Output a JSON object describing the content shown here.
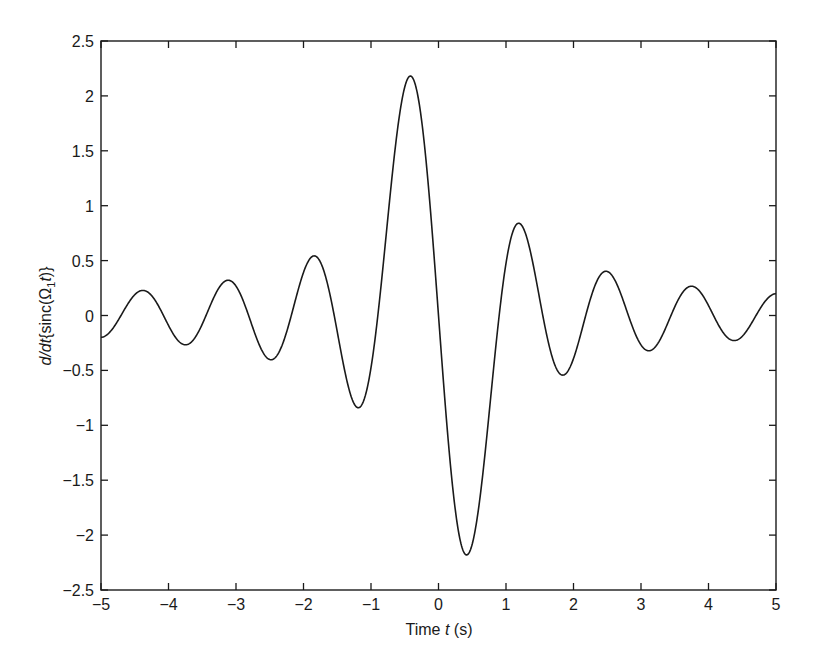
{
  "chart_data": {
    "type": "line",
    "title": "",
    "xlabel": "Time t (s)",
    "xlabel_parts": {
      "prefix": "Time ",
      "italic": "t",
      "suffix": " (s)"
    },
    "ylabel": "d/dt{sinc(Ω1t)}",
    "ylabel_parts": {
      "italic1": "d/dt",
      "mid": "{sinc(Ω",
      "sub": "1",
      "italic2": "t",
      "suffix": ")}"
    },
    "xlim": [
      -5,
      5
    ],
    "ylim": [
      -2.5,
      2.5
    ],
    "xticks": [
      -5,
      -4,
      -3,
      -2,
      -1,
      0,
      1,
      2,
      3,
      4,
      5
    ],
    "xtick_labels": [
      "−5",
      "−4",
      "−3",
      "−2",
      "−1",
      "0",
      "1",
      "2",
      "3",
      "4",
      "5"
    ],
    "yticks": [
      -2.5,
      -2,
      -1.5,
      -1,
      -0.5,
      0,
      0.5,
      1,
      1.5,
      2,
      2.5
    ],
    "ytick_labels": [
      "−2.5",
      "−2",
      "−1.5",
      "−1",
      "−0.5",
      "0",
      "0.5",
      "1",
      "1.5",
      "2",
      "2.5"
    ],
    "grid": false,
    "legend": null,
    "function": {
      "expression": "cos(Ω1 t)/t − sin(Ω1 t)/(Ω1 t²)",
      "omega1": 5
    },
    "series": [
      {
        "name": "d/dt{sinc(Ω1t)}",
        "color": "#1a1a1a",
        "x": [
          -5,
          -4.75,
          -4.5,
          -4.25,
          -4,
          -3.75,
          -3.5,
          -3.25,
          -3,
          -2.75,
          -2.5,
          -2.25,
          -2,
          -1.75,
          -1.5,
          -1.25,
          -1,
          -0.75,
          -0.5,
          -0.42,
          -0.25,
          0,
          0.25,
          0.42,
          0.5,
          0.75,
          1,
          1.25,
          1.5,
          1.75,
          2,
          2.25,
          2.5,
          2.75,
          3,
          3.25,
          3.5,
          3.75,
          4,
          4.25,
          4.5,
          4.75,
          5
        ],
        "y": [
          -0.199,
          -0.04,
          0.189,
          0.181,
          -0.091,
          -0.267,
          -0.068,
          0.254,
          0.268,
          -0.116,
          -0.401,
          -0.134,
          0.392,
          0.488,
          -0.148,
          -0.804,
          -0.476,
          0.891,
          2.081,
          2.18,
          1.776,
          0,
          -1.776,
          -2.18,
          -2.081,
          -0.891,
          0.476,
          0.804,
          0.148,
          -0.488,
          -0.392,
          0.134,
          0.401,
          0.116,
          -0.268,
          -0.254,
          0.068,
          0.267,
          0.091,
          -0.181,
          -0.189,
          0.04,
          0.199
        ]
      }
    ]
  }
}
